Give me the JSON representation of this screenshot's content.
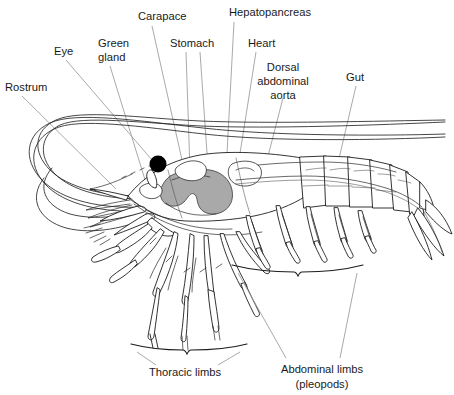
{
  "figure": {
    "style": "line-drawing",
    "background_color": "#ffffff",
    "line_color": "#1d1d1d",
    "leader_color": "#9a9a9a",
    "organ_fill_color": "#a9a9a9",
    "eye_color": "#000000"
  },
  "labels": {
    "rostrum": "Rostrum",
    "eye": "Eye",
    "green_gland_line1": "Green",
    "green_gland_line2": "gland",
    "carapace": "Carapace",
    "stomach": "Stomach",
    "hepatopancreas": "Hepatopancreas",
    "heart": "Heart",
    "aorta_line1": "Dorsal",
    "aorta_line2": "abdominal",
    "aorta_line3": "aorta",
    "gut": "Gut",
    "thoracic_limbs": "Thoracic limbs",
    "abdominal_limbs_line1": "Abdominal limbs",
    "abdominal_limbs_line2": "(pleopods)"
  },
  "annotations": [
    {
      "id": "rostrum",
      "text": "Rostrum",
      "x": 5,
      "y": 88,
      "anchor": "start"
    },
    {
      "id": "eye",
      "text": "Eye",
      "x": 54,
      "y": 52,
      "anchor": "start"
    },
    {
      "id": "green-gland",
      "text": "Green gland",
      "x": 98,
      "y": 44,
      "anchor": "start"
    },
    {
      "id": "carapace",
      "text": "Carapace",
      "x": 138,
      "y": 17,
      "anchor": "start"
    },
    {
      "id": "stomach",
      "text": "Stomach",
      "x": 170,
      "y": 44,
      "anchor": "start"
    },
    {
      "id": "hepatopancreas",
      "text": "Hepatopancreas",
      "x": 229,
      "y": 13,
      "anchor": "start"
    },
    {
      "id": "heart",
      "text": "Heart",
      "x": 248,
      "y": 44,
      "anchor": "start"
    },
    {
      "id": "dorsal-aorta",
      "text": "Dorsal abdominal aorta",
      "x": 283,
      "y": 68,
      "anchor": "middle"
    },
    {
      "id": "gut",
      "text": "Gut",
      "x": 346,
      "y": 78,
      "anchor": "start"
    },
    {
      "id": "thoracic-limbs",
      "text": "Thoracic limbs",
      "x": 185,
      "y": 373,
      "anchor": "middle"
    },
    {
      "id": "abdominal-limbs",
      "text": "Abdominal limbs (pleopods)",
      "x": 322,
      "y": 370,
      "anchor": "middle"
    }
  ],
  "brackets": [
    {
      "id": "thoracic-limbs-bracket",
      "left_x": 131,
      "right_x": 247,
      "y": 348,
      "label": "Thoracic limbs"
    },
    {
      "id": "abdominal-limbs-bracket",
      "left_x": 232,
      "right_x": 363,
      "y": 268,
      "label": "Abdominal limbs (pleopods)"
    }
  ],
  "anatomy_parts": [
    "rostrum",
    "eye",
    "green gland",
    "carapace",
    "stomach",
    "hepatopancreas",
    "heart",
    "dorsal abdominal aorta",
    "gut",
    "thoracic limbs",
    "abdominal limbs (pleopods)",
    "antennae",
    "abdomen segments",
    "telson",
    "uropods"
  ]
}
